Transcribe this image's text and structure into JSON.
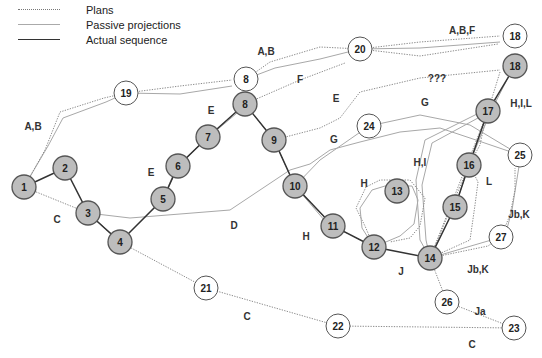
{
  "legend": {
    "plans": "Plans",
    "passive": "Passive projections",
    "actual": "Actual sequence"
  },
  "colors": {
    "actual_node_fill": "#bdbdbd",
    "plan_node_fill": "#ffffff",
    "line": "#333333"
  },
  "nodes": [
    {
      "id": "1",
      "label": "1",
      "x": 24,
      "y": 187,
      "type": "actual"
    },
    {
      "id": "2",
      "label": "2",
      "x": 65,
      "y": 168,
      "type": "actual"
    },
    {
      "id": "3",
      "label": "3",
      "x": 88,
      "y": 213,
      "type": "actual"
    },
    {
      "id": "4",
      "label": "4",
      "x": 120,
      "y": 242,
      "type": "actual"
    },
    {
      "id": "5",
      "label": "5",
      "x": 163,
      "y": 199,
      "type": "actual"
    },
    {
      "id": "6",
      "label": "6",
      "x": 178,
      "y": 166,
      "type": "actual"
    },
    {
      "id": "7",
      "label": "7",
      "x": 208,
      "y": 137,
      "type": "actual"
    },
    {
      "id": "8",
      "label": "8",
      "x": 245,
      "y": 104,
      "type": "actual"
    },
    {
      "id": "8p",
      "label": "8",
      "x": 246,
      "y": 79,
      "type": "plan"
    },
    {
      "id": "9",
      "label": "9",
      "x": 274,
      "y": 140,
      "type": "actual"
    },
    {
      "id": "10",
      "label": "10",
      "x": 295,
      "y": 186,
      "type": "actual"
    },
    {
      "id": "11",
      "label": "11",
      "x": 333,
      "y": 226,
      "type": "actual"
    },
    {
      "id": "12",
      "label": "12",
      "x": 374,
      "y": 247,
      "type": "actual"
    },
    {
      "id": "13",
      "label": "13",
      "x": 397,
      "y": 191,
      "type": "actual"
    },
    {
      "id": "14",
      "label": "14",
      "x": 430,
      "y": 258,
      "type": "actual"
    },
    {
      "id": "15",
      "label": "15",
      "x": 455,
      "y": 207,
      "type": "actual"
    },
    {
      "id": "16",
      "label": "16",
      "x": 469,
      "y": 165,
      "type": "actual"
    },
    {
      "id": "17",
      "label": "17",
      "x": 488,
      "y": 111,
      "type": "actual"
    },
    {
      "id": "18",
      "label": "18",
      "x": 515,
      "y": 66,
      "type": "actual"
    },
    {
      "id": "18p",
      "label": "18",
      "x": 515,
      "y": 36,
      "type": "plan"
    },
    {
      "id": "19",
      "label": "19",
      "x": 126,
      "y": 93,
      "type": "plan"
    },
    {
      "id": "20",
      "label": "20",
      "x": 360,
      "y": 49,
      "type": "plan"
    },
    {
      "id": "21",
      "label": "21",
      "x": 206,
      "y": 288,
      "type": "plan"
    },
    {
      "id": "22",
      "label": "22",
      "x": 338,
      "y": 326,
      "type": "plan"
    },
    {
      "id": "23",
      "label": "23",
      "x": 514,
      "y": 328,
      "type": "plan"
    },
    {
      "id": "24",
      "label": "24",
      "x": 369,
      "y": 126,
      "type": "plan"
    },
    {
      "id": "25",
      "label": "25",
      "x": 520,
      "y": 155,
      "type": "plan"
    },
    {
      "id": "26",
      "label": "26",
      "x": 447,
      "y": 302,
      "type": "plan"
    },
    {
      "id": "27",
      "label": "27",
      "x": 501,
      "y": 237,
      "type": "plan"
    }
  ],
  "edge_labels": [
    {
      "text": "A,B",
      "x": 33,
      "y": 126
    },
    {
      "text": "A,B",
      "x": 266,
      "y": 51
    },
    {
      "text": "A,B,F",
      "x": 462,
      "y": 30
    },
    {
      "text": "F",
      "x": 300,
      "y": 79
    },
    {
      "text": "E",
      "x": 336,
      "y": 98
    },
    {
      "text": "E",
      "x": 151,
      "y": 172
    },
    {
      "text": "E",
      "x": 211,
      "y": 110
    },
    {
      "text": "???",
      "x": 437,
      "y": 78
    },
    {
      "text": "G",
      "x": 425,
      "y": 102
    },
    {
      "text": "G",
      "x": 334,
      "y": 139
    },
    {
      "text": "H,I,L",
      "x": 521,
      "y": 103
    },
    {
      "text": "H,I",
      "x": 420,
      "y": 162
    },
    {
      "text": "H",
      "x": 364,
      "y": 183
    },
    {
      "text": "L",
      "x": 489,
      "y": 181
    },
    {
      "text": "Jb,K",
      "x": 519,
      "y": 214
    },
    {
      "text": "Jb,K",
      "x": 478,
      "y": 269
    },
    {
      "text": "Ja",
      "x": 480,
      "y": 311
    },
    {
      "text": "J",
      "x": 401,
      "y": 271
    },
    {
      "text": "C",
      "x": 57,
      "y": 219
    },
    {
      "text": "D",
      "x": 234,
      "y": 225
    },
    {
      "text": "H",
      "x": 306,
      "y": 236
    },
    {
      "text": "C",
      "x": 247,
      "y": 316
    },
    {
      "text": "C",
      "x": 472,
      "y": 344
    }
  ],
  "paths": {
    "actual": [
      "M24,187 L65,168 L88,213 L120,242 L163,199 L178,166 L208,137 L245,104 L274,140 L295,186 L333,226 L374,247 L430,258 L455,207 L469,165 L488,111 L515,66"
    ],
    "plans": [
      "M24,187 L45,150 L60,112 L104,98 L126,93",
      "M126,93 L180,86 L232,80",
      "M246,79 L270,62 L320,47 L360,49",
      "M360,49 L420,42 L500,36",
      "M360,49 L420,56 L498,44",
      "M245,104 L300,80 L345,63",
      "M274,140 L320,128 L340,118 L360,92 L420,78 L500,70",
      "M24,187 L88,213 L120,242 L206,288 L338,326 L514,328",
      "M430,258 L447,302 L514,328",
      "M374,247 L365,226 L356,208 L366,187 L380,180 L410,180 L425,198 L420,226 L410,238 L390,242",
      "M430,258 L488,111 L500,72",
      "M430,258 L469,165 L480,145 L485,121",
      "M430,258 L488,246 L501,237 L510,215 L515,190 L515,168",
      "M430,258 L470,240 L475,205 L478,182 L472,170",
      "M163,199 L178,166 L208,137 L245,104 L274,140 L295,186",
      "M295,186 L333,226 L374,247"
    ],
    "passive": [
      "M24,187 L48,146 L63,118 L106,102 L126,93",
      "M126,93 L180,94 L232,86",
      "M246,79 L275,68 L320,59 L360,49",
      "M360,49 L420,48 L500,42",
      "M88,213 L130,218 L230,210 L290,170 L310,164 L330,150 L360,142 L400,132 L440,128 L470,138 L520,155",
      "M295,186 L320,160 L369,126",
      "M369,126 L420,115 L470,125 L520,155",
      "M374,247 L362,228 L360,208 L372,190 L385,186 L412,186 L418,200 L414,224 L400,236 L374,247",
      "M430,258 L420,240 L416,180 L425,140 L485,110",
      "M430,258 L426,240 L422,185 L432,143 L478,118",
      "M163,199 L176,168 L205,140 L243,108",
      "M430,258 L505,236 L512,210 L520,160",
      "M88,213 L123,244",
      "M295,186 L331,228",
      "M455,207 L469,165 L490,113 L512,70"
    ]
  }
}
